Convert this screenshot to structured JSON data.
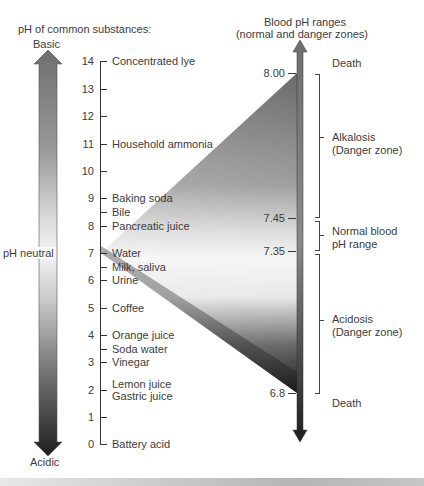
{
  "left_scale": {
    "title": "pH of common substances:",
    "top_label": "Basic",
    "bottom_label": "Acidic",
    "neutral_label": "pH neutral",
    "ticks": [
      {
        "value": "14",
        "y": 61
      },
      {
        "value": "13",
        "y": 89
      },
      {
        "value": "12",
        "y": 116
      },
      {
        "value": "11",
        "y": 144
      },
      {
        "value": "10",
        "y": 171
      },
      {
        "value": "9",
        "y": 198
      },
      {
        "value": "8",
        "y": 226
      },
      {
        "value": "7",
        "y": 253
      },
      {
        "value": "6",
        "y": 280
      },
      {
        "value": "5",
        "y": 308
      },
      {
        "value": "4",
        "y": 335
      },
      {
        "value": "3",
        "y": 362
      },
      {
        "value": "2",
        "y": 390
      },
      {
        "value": "1",
        "y": 417
      },
      {
        "value": "0",
        "y": 444
      }
    ],
    "substances": [
      {
        "label": "Concentrated lye",
        "ph": 14,
        "y": 61
      },
      {
        "label": "Household ammonia",
        "ph": 11,
        "y": 144
      },
      {
        "label": "Baking soda",
        "ph": 9,
        "y": 198
      },
      {
        "label": "Bile",
        "ph": 8.5,
        "y": 212
      },
      {
        "label": "Pancreatic juice",
        "ph": 8,
        "y": 226
      },
      {
        "label": "Water",
        "ph": 7,
        "y": 253
      },
      {
        "label": "Milk, saliva",
        "ph": 6.5,
        "y": 267
      },
      {
        "label": "Urine",
        "ph": 6,
        "y": 280
      },
      {
        "label": "Coffee",
        "ph": 5,
        "y": 308
      },
      {
        "label": "Orange juice",
        "ph": 4,
        "y": 335
      },
      {
        "label": "Soda water",
        "ph": 3.5,
        "y": 349
      },
      {
        "label": "Vinegar",
        "ph": 3,
        "y": 362
      },
      {
        "label": "Lemon juice",
        "ph": 2,
        "y": 384
      },
      {
        "label": "Gastric juice",
        "ph": 2,
        "y": 396
      },
      {
        "label": "Battery acid",
        "ph": 0,
        "y": 444
      }
    ]
  },
  "right_scale": {
    "title_line1": "Blood pH ranges",
    "title_line2": "(normal and danger zones)",
    "ticks": [
      {
        "value": "8.00",
        "y": 73
      },
      {
        "value": "7.45",
        "y": 218
      },
      {
        "value": "7.35",
        "y": 251
      },
      {
        "value": "6.8",
        "y": 393
      }
    ],
    "zones": [
      {
        "label": "Death",
        "y": 63
      },
      {
        "label": "Alkalosis",
        "label2": "(Danger zone)",
        "y": 134
      },
      {
        "label": "Normal blood",
        "label2": "pH range",
        "y": 228
      },
      {
        "label": "Acidosis",
        "label2": "(Danger zone)",
        "y": 314
      },
      {
        "label": "Death",
        "y": 396
      }
    ]
  },
  "colors": {
    "arrow_dark": "#2a2a2a",
    "arrow_light": "#f2f2f2",
    "mid_gray": "#8a8a8a",
    "text": "#3c3c3c"
  }
}
